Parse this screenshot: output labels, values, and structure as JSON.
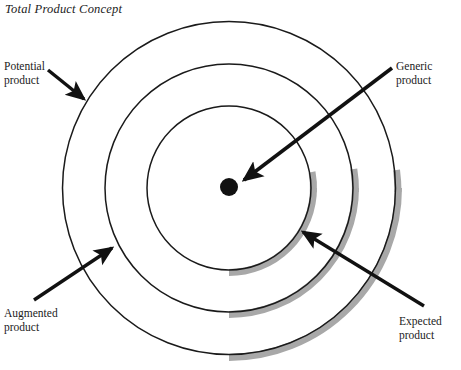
{
  "figure": {
    "title": "Total Product Concept",
    "type": "concentric-circles-diagram",
    "center_marker": "generic-product-dot",
    "colors": {
      "stroke": "#1a1a1a",
      "shadow": "#a8a8a8",
      "background": "#ffffff",
      "text": "#1b1b1b"
    }
  },
  "labels": {
    "potential": {
      "line1": "Potential",
      "line2": "product"
    },
    "augmented": {
      "line1": "Augmented",
      "line2": "product"
    },
    "generic": {
      "line1": "Generic",
      "line2": "product"
    },
    "expected": {
      "line1": "Expected",
      "line2": "product"
    }
  },
  "rings": [
    {
      "name": "potential-product-ring",
      "radius": 167,
      "order": 1
    },
    {
      "name": "augmented-product-ring",
      "radius": 124,
      "order": 2
    },
    {
      "name": "expected-product-ring",
      "radius": 82,
      "order": 3
    },
    {
      "name": "generic-product-core",
      "radius": 9,
      "order": 4
    }
  ],
  "arrows": [
    {
      "name": "potential-product-arrow",
      "from": "Potential product",
      "to": "outer ring"
    },
    {
      "name": "augmented-product-arrow",
      "from": "Augmented product",
      "to": "middle ring"
    },
    {
      "name": "generic-product-arrow",
      "from": "Generic product",
      "to": "center dot"
    },
    {
      "name": "expected-product-arrow",
      "from": "Expected product",
      "to": "inner ring"
    }
  ]
}
